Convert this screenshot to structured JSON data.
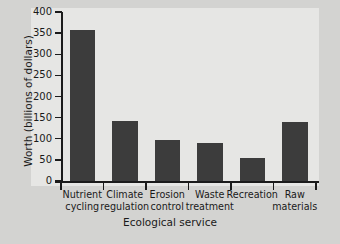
{
  "chart_data": {
    "type": "bar",
    "title": "",
    "xlabel": "Ecological service",
    "ylabel": "Worth (billions of dollars)",
    "categories": [
      "Nutrient cycling",
      "Climate regulation",
      "Erosion control",
      "Waste treatment",
      "Recreation",
      "Raw materials"
    ],
    "category_lines": [
      [
        "Nutrient",
        "cycling"
      ],
      [
        "Climate",
        "regulation"
      ],
      [
        "Erosion",
        "control"
      ],
      [
        "Waste",
        "treatment"
      ],
      [
        "Recreation",
        ""
      ],
      [
        "Raw",
        "materials"
      ]
    ],
    "values": [
      357,
      142,
      98,
      89,
      55,
      140
    ],
    "ylim": [
      0,
      400
    ],
    "yticks": [
      0,
      50,
      100,
      150,
      200,
      250,
      300,
      350,
      400
    ],
    "ytick_labels": [
      "0",
      "50",
      "100",
      "150",
      "200",
      "250",
      "300",
      "350",
      "400"
    ],
    "grid": false,
    "legend": "none",
    "bar_color": "#3c3c3c",
    "axis_color": "#1b1b1b",
    "panel_color": "#e6e6e4",
    "background_color": "#d3d3d1"
  }
}
